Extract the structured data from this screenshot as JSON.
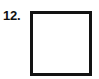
{
  "page": {
    "background_color": "#ffffff",
    "width": 99,
    "height": 79
  },
  "item": {
    "number_label": "12.",
    "shape": {
      "name": "square",
      "icon_name": "square-outline-icon",
      "stroke_color": "#131313",
      "fill_color": "#ffffff",
      "stroke_width_px": 3,
      "width_px": 56,
      "height_px": 59,
      "interior_text": ""
    }
  }
}
